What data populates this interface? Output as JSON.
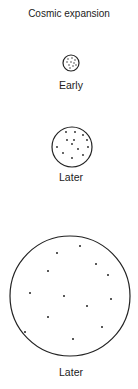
{
  "title": "Cosmic expansion",
  "stages": [
    {
      "label": "Early",
      "cx": 71,
      "cy": 63,
      "r": 8,
      "dots": [
        [
          68,
          59
        ],
        [
          72,
          58
        ],
        [
          75,
          60
        ],
        [
          67,
          62
        ],
        [
          71,
          62
        ],
        [
          74,
          63
        ],
        [
          69,
          65
        ],
        [
          73,
          66
        ],
        [
          76,
          65
        ],
        [
          70,
          68
        ]
      ]
    },
    {
      "label": "Later",
      "cx": 72,
      "cy": 147,
      "r": 20,
      "dots": [
        [
          66,
          132
        ],
        [
          75,
          132
        ],
        [
          83,
          135
        ],
        [
          67,
          140
        ],
        [
          74,
          140
        ],
        [
          72,
          144
        ],
        [
          87,
          140
        ],
        [
          57,
          147
        ],
        [
          78,
          149
        ],
        [
          88,
          147
        ],
        [
          63,
          153
        ],
        [
          83,
          155
        ],
        [
          72,
          158
        ]
      ]
    },
    {
      "label": "Later",
      "cx": 70,
      "cy": 296,
      "r": 60,
      "dots": [
        [
          80,
          246
        ],
        [
          57,
          253
        ],
        [
          96,
          264
        ],
        [
          48,
          271
        ],
        [
          108,
          275
        ],
        [
          30,
          293
        ],
        [
          64,
          296
        ],
        [
          111,
          299
        ],
        [
          87,
          306
        ],
        [
          48,
          317
        ],
        [
          102,
          327
        ],
        [
          25,
          332
        ],
        [
          73,
          339
        ]
      ]
    }
  ],
  "colors": {
    "stroke": "#222222",
    "dot": "#222222"
  }
}
